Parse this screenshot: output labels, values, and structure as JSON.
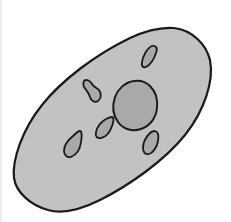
{
  "diagram": {
    "title": "Cell illustration",
    "colors": {
      "background": "#ffffff",
      "cell_fill": "#c2c2c2",
      "nucleus_fill": "#a9a9a9",
      "organelle_fill": "#a9a9a9",
      "outline": "#1a1a1a"
    },
    "parts": {
      "cell": "cell-membrane",
      "nucleus": "nucleus",
      "organelles": [
        "organelle-top-right",
        "organelle-upper-left",
        "organelle-center-left",
        "organelle-lower-left",
        "organelle-lower-right"
      ]
    }
  }
}
